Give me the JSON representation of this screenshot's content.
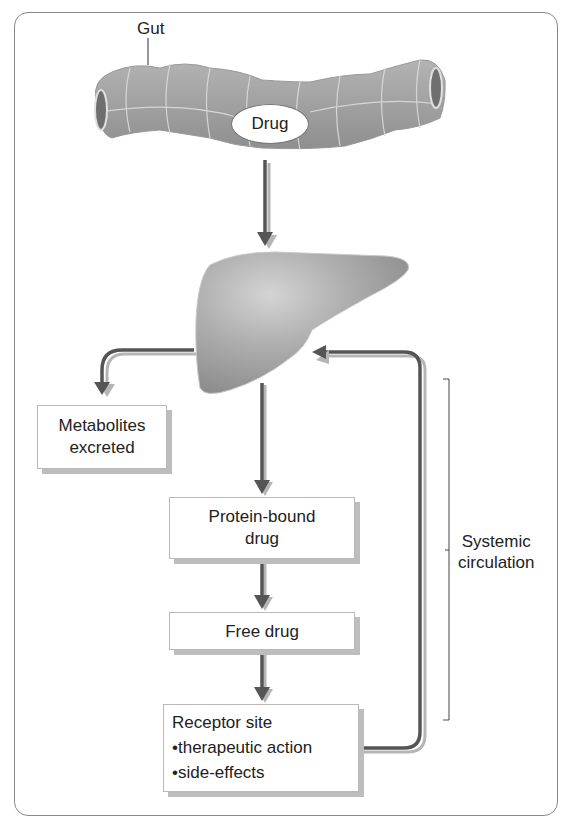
{
  "diagram": {
    "gut": {
      "label": "Gut",
      "content_label": "Drug"
    },
    "organ": {
      "name": "Liver"
    },
    "nodes": {
      "metabolites": {
        "line1": "Metabolites",
        "line2": "excreted"
      },
      "protein_bound": {
        "line1": "Protein-bound",
        "line2": "drug"
      },
      "free_drug": {
        "label": "Free drug"
      },
      "receptor": {
        "title": "Receptor site",
        "bullets": [
          "•therapeutic action",
          "•side-effects"
        ]
      }
    },
    "bracket": {
      "line1": "Systemic",
      "line2": "circulation"
    },
    "flows": [
      {
        "from": "Gut",
        "to": "Liver"
      },
      {
        "from": "Liver",
        "to": "Metabolites excreted"
      },
      {
        "from": "Liver",
        "to": "Protein-bound drug"
      },
      {
        "from": "Protein-bound drug",
        "to": "Free drug"
      },
      {
        "from": "Free drug",
        "to": "Receptor site"
      },
      {
        "from": "Receptor site",
        "to": "Liver"
      }
    ],
    "colors": {
      "arrow_dark": "#555555",
      "arrow_light": "#b5b5b5",
      "organ_fill": "#a9a9a9",
      "frame": "#888888"
    }
  }
}
